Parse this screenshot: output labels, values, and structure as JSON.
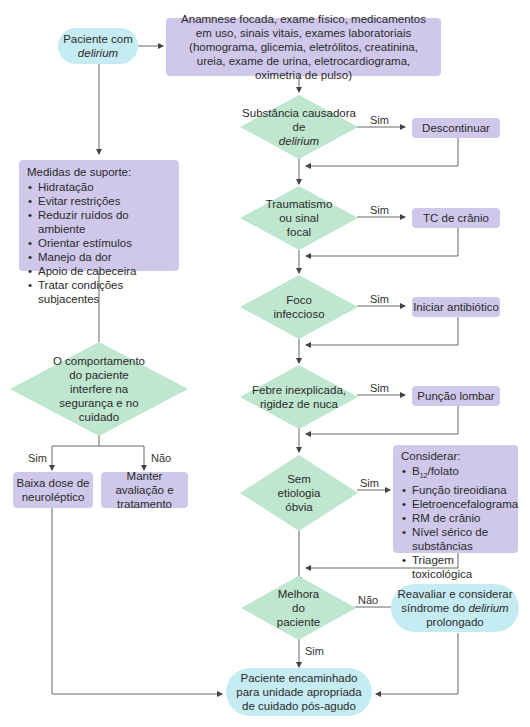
{
  "flowchart": {
    "start": {
      "text_prefix": "Paciente com",
      "text_italic": "delirium"
    },
    "assessment": "Anamnese focada, exame físico, medicamentos em uso, sinais vitais, exames laboratoriais (homograma, glicemia, eletrólitos, creatinina, ureia, exame de urina, eletrocardiograma, oximetria de pulso)",
    "support": {
      "title": "Medidas de suporte:",
      "items": [
        "Hidratação",
        "Evitar restrições",
        "Reduzir ruídos do ambiente",
        "Orientar estímulos",
        "Manejo da dor",
        "Apoio de cabeceira",
        "Tratar condições subjacentes"
      ]
    },
    "behavior_decision": "O comportamento do paciente interfere na segurança e no cuidado",
    "behavior_yes_label": "Sim",
    "behavior_no_label": "Não",
    "behavior_yes_action": "Baixa dose de neuroléptico",
    "behavior_no_action": "Manter avaliação e tratamento",
    "decisions": [
      {
        "text_prefix": "Substância causadora de",
        "text_italic": "delirium",
        "yes_label": "Sim",
        "action": "Descontinuar"
      },
      {
        "text": "Traumatismo ou sinal focal",
        "yes_label": "Sim",
        "action": "TC de crânio"
      },
      {
        "text": "Foco infeccioso",
        "yes_label": "Sim",
        "action": "Iniciar antibiótico"
      },
      {
        "text": "Febre inexplicada, rigidez de nuca",
        "yes_label": "Sim",
        "action": "Punção lombar"
      },
      {
        "text": "Sem etiologia óbvia",
        "yes_label": "Sim"
      }
    ],
    "consider": {
      "title": "Considerar:",
      "b12_main": "B",
      "b12_sub": "12",
      "b12_rest": "/folato",
      "items": [
        "Função tireoidiana",
        "Eletroencefalograma",
        "RM de crânio",
        "Nível sérico de substâncias",
        "Triagem toxicológica"
      ]
    },
    "improvement": {
      "text": "Melhora do paciente",
      "yes_label": "Sim",
      "no_label": "Não"
    },
    "reevaluate": {
      "text_prefix": "Reavaliar e considerar síndrome do",
      "text_italic": "delirium",
      "text_suffix": "prolongado"
    },
    "end": "Paciente encaminhado para unidade apropriada de cuidado pós-agudo"
  },
  "colors": {
    "pill": "#c6ecf3",
    "rect": "#cfc8ea",
    "diamond": "#bfe6cf",
    "line": "#555555"
  }
}
